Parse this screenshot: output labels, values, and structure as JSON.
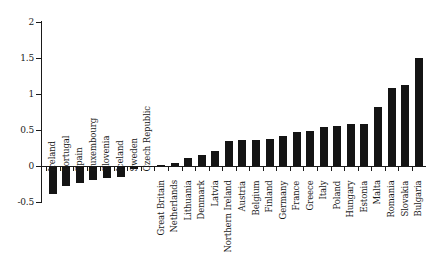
{
  "chart_data": {
    "type": "bar",
    "title": "",
    "subtitle": "",
    "xlabel": "",
    "ylabel": "",
    "ylim": [
      -0.5,
      2
    ],
    "ytick_labels": [
      "2",
      "1.5",
      "1",
      "0.5",
      "0",
      "-0.5"
    ],
    "ytick_values": [
      2,
      1.5,
      1,
      0.5,
      0,
      -0.5
    ],
    "grid": false,
    "legend": null,
    "bar_color": "#141414",
    "axis_color": "#1a1a1a",
    "background": "#ffffff",
    "orientation": "vertical",
    "label_rotation": 90,
    "categories": [
      "Ireland",
      "Portugal",
      "Spain",
      "Luxembourg",
      "Slovenia",
      "Iceland",
      "Sweden",
      "Czech Republic",
      "Great Britain",
      "Netherlands",
      "Lithuania",
      "Denmark",
      "Latvia",
      "Northern Ireland",
      "Austria",
      "Belgium",
      "Finland",
      "Germany",
      "France",
      "Greece",
      "Italy",
      "Poland",
      "Hungary",
      "Estonia",
      "Malta",
      "Romania",
      "Slovakia",
      "Bulgaria"
    ],
    "values": [
      -0.39,
      -0.28,
      -0.24,
      -0.2,
      -0.17,
      -0.15,
      -0.04,
      -0.02,
      0.02,
      0.04,
      0.11,
      0.15,
      0.21,
      0.35,
      0.36,
      0.36,
      0.37,
      0.41,
      0.47,
      0.49,
      0.54,
      0.56,
      0.58,
      0.59,
      0.82,
      1.08,
      1.12,
      1.5
    ]
  }
}
